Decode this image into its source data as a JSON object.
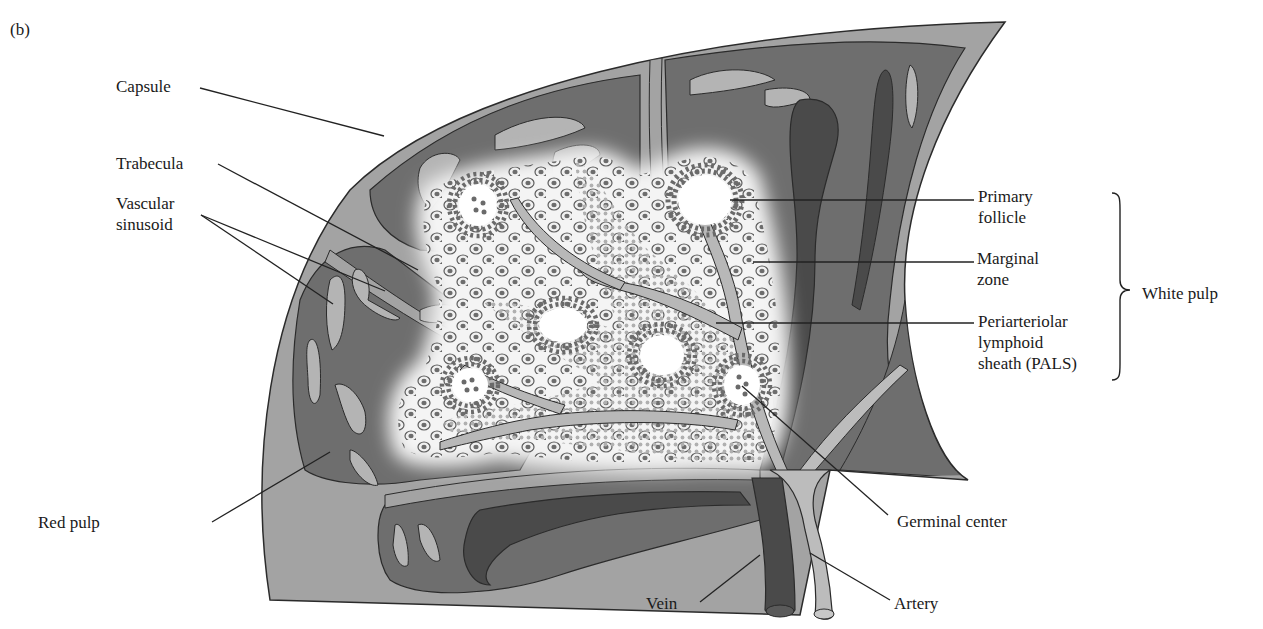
{
  "figure": {
    "panel_label": "(b)",
    "colors": {
      "background": "#ffffff",
      "capsule": "#a3a3a3",
      "red_pulp": "#6e6e6e",
      "sinusoid": "#b4b4b4",
      "white_pulp": "#f2f2f2",
      "vein": "#4a4a4a",
      "artery": "#bcbcbc",
      "cell_ring": "#6a6a6a",
      "pals_dots": "#b0b0b0",
      "outline": "#2b2b2b",
      "leader": "#222222"
    }
  },
  "labels": {
    "capsule": {
      "text": "Capsule",
      "x": 116,
      "y": 76
    },
    "trabecula": {
      "text": "Trabecula",
      "x": 116,
      "y": 153
    },
    "vascular_sinusoid": {
      "line1": "Vascular",
      "line2": "sinusoid",
      "x": 116,
      "y": 193
    },
    "red_pulp": {
      "text": "Red pulp",
      "x": 38,
      "y": 512
    },
    "primary_follicle": {
      "line1": "Primary",
      "line2": "follicle",
      "x": 978,
      "y": 186
    },
    "marginal_zone": {
      "line1": "Marginal",
      "line2": "zone",
      "x": 977,
      "y": 248
    },
    "pals": {
      "line1": "Periarteriolar",
      "line2": "lymphoid",
      "line3": "sheath (PALS)",
      "x": 978,
      "y": 311
    },
    "white_pulp": {
      "text": "White pulp",
      "x": 1142,
      "y": 283
    },
    "germinal_center": {
      "text": "Germinal center",
      "x": 897,
      "y": 511
    },
    "vein": {
      "text": "Vein",
      "x": 646,
      "y": 593
    },
    "artery": {
      "text": "Artery",
      "x": 894,
      "y": 593
    }
  },
  "leaders": [
    {
      "name": "capsule-leader",
      "x1": 200,
      "y1": 88,
      "x2": 384,
      "y2": 136
    },
    {
      "name": "trabecula-leader",
      "x1": 218,
      "y1": 164,
      "x2": 418,
      "y2": 270
    },
    {
      "name": "sinusoid-leader-1",
      "x1": 201,
      "y1": 215,
      "x2": 333,
      "y2": 304
    },
    {
      "name": "sinusoid-leader-2",
      "x1": 201,
      "y1": 215,
      "x2": 385,
      "y2": 291
    },
    {
      "name": "red-pulp-leader",
      "x1": 212,
      "y1": 522,
      "x2": 330,
      "y2": 452
    },
    {
      "name": "primary-follicle-leader",
      "x1": 730,
      "y1": 200,
      "x2": 974,
      "y2": 200
    },
    {
      "name": "marginal-zone-leader",
      "x1": 753,
      "y1": 262,
      "x2": 974,
      "y2": 262
    },
    {
      "name": "pals-leader",
      "x1": 716,
      "y1": 323,
      "x2": 974,
      "y2": 323
    },
    {
      "name": "germinal-center-leader",
      "x1": 742,
      "y1": 386,
      "x2": 888,
      "y2": 515
    },
    {
      "name": "vein-leader",
      "x1": 700,
      "y1": 602,
      "x2": 760,
      "y2": 555
    },
    {
      "name": "artery-leader",
      "x1": 890,
      "y1": 600,
      "x2": 810,
      "y2": 553
    }
  ],
  "white_pulp_bracket": {
    "x": 1120,
    "y_top": 193,
    "y_mid": 290,
    "y_bottom": 380
  }
}
